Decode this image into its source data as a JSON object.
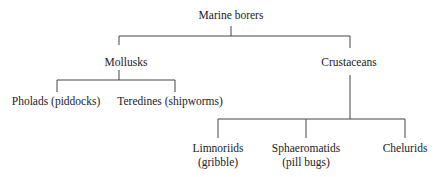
{
  "diagram": {
    "type": "tree",
    "root": {
      "label": "Marine borers",
      "children": [
        {
          "label": "Mollusks",
          "children": [
            {
              "label": "Pholads (piddocks)"
            },
            {
              "label": "Teredines (shipworms)"
            }
          ]
        },
        {
          "label": "Crustaceans",
          "children": [
            {
              "label_line1": "Limnoriids",
              "label_line2": "(gribble)"
            },
            {
              "label_line1": "Sphaeromatids",
              "label_line2": "(pill bugs)"
            },
            {
              "label": "Chelurids"
            }
          ]
        }
      ]
    }
  }
}
